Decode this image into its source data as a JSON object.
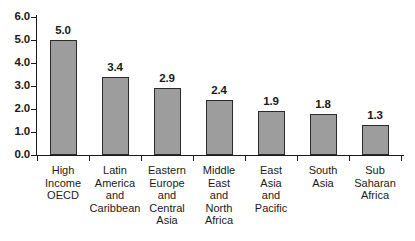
{
  "chart_data": {
    "type": "bar",
    "title": "",
    "subtitle": "",
    "xlabel": "",
    "ylabel": "",
    "ylim": [
      0.0,
      6.0
    ],
    "ytick_step": 1.0,
    "ytick_labels": [
      "6.0",
      "5.0",
      "4.0",
      "3.0",
      "2.0",
      "1.0",
      "0.0"
    ],
    "ytick_values": [
      6.0,
      5.0,
      4.0,
      3.0,
      2.0,
      1.0,
      0.0
    ],
    "grid": false,
    "legend": false,
    "legend_position": "none",
    "orientation": "vertical",
    "categories": [
      "High Income OECD",
      "Latin America and Caribbean",
      "Eastern Europe and Central Asia",
      "Middle East and North Africa",
      "East Asia and Pacific",
      "South Asia",
      "Sub Saharan Africa"
    ],
    "category_lines": [
      [
        "High",
        "Income",
        "OECD"
      ],
      [
        "Latin",
        "America",
        "and",
        "Caribbean"
      ],
      [
        "Eastern",
        "Europe",
        "and",
        "Central",
        "Asia"
      ],
      [
        "Middle",
        "East",
        "and",
        "North",
        "Africa"
      ],
      [
        "East",
        "Asia",
        "and",
        "Pacific"
      ],
      [
        "South",
        "Asia"
      ],
      [
        "Sub",
        "Saharan",
        "Africa"
      ]
    ],
    "values": [
      5.0,
      3.4,
      2.9,
      2.4,
      1.9,
      1.8,
      1.3
    ],
    "value_labels": [
      "5.0",
      "3.4",
      "2.9",
      "2.4",
      "1.9",
      "1.8",
      "1.3"
    ],
    "bar_color": "#9d9d9d",
    "bar_border_color": "#2b2b2b",
    "axis_color": "#1a1a1a",
    "background_color": "#ffffff"
  }
}
